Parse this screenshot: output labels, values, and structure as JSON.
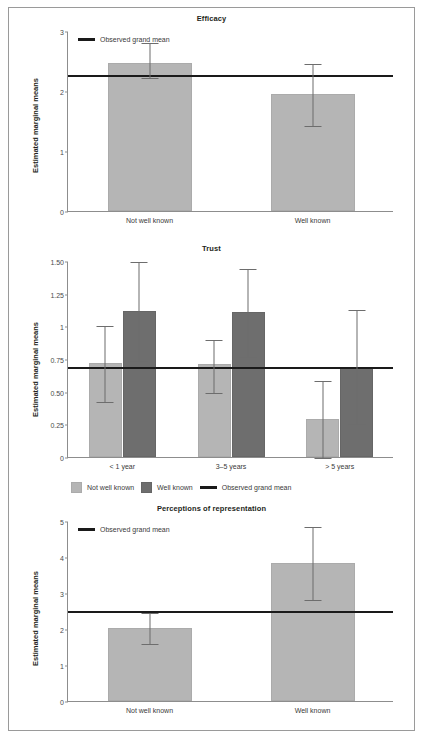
{
  "figure": {
    "ylabel": "Estimated marginal means",
    "grand_mean_legend": "Observed grand mean",
    "legend_items": [
      "Not well known",
      "Well known",
      "Observed grand mean"
    ]
  },
  "chart_data": [
    {
      "type": "bar",
      "title": "Efficacy",
      "xlabel": "",
      "ylabel": "Estimated marginal means",
      "categories": [
        "Not well known",
        "Well known"
      ],
      "values": [
        2.47,
        1.95
      ],
      "error_low": [
        2.23,
        1.44
      ],
      "error_high": [
        2.81,
        2.46
      ],
      "grand_mean": 2.27,
      "ylim": [
        0,
        3
      ],
      "yticks": [
        "0",
        "1",
        "2",
        "3"
      ],
      "ytick_values": [
        0,
        1,
        2,
        3
      ],
      "grid": false,
      "legend": [
        "Observed grand mean"
      ],
      "legend_position": "top-left",
      "bar_style": [
        "light",
        "light"
      ]
    },
    {
      "type": "bar",
      "title": "Trust",
      "xlabel": "",
      "ylabel": "Estimated marginal means",
      "categories": [
        "< 1 year",
        "3–5 years",
        "> 5 years"
      ],
      "series": [
        {
          "name": "Not well known",
          "style": "light",
          "values": [
            0.72,
            0.71,
            0.29
          ],
          "error_low": [
            0.43,
            0.5,
            0.0
          ],
          "error_high": [
            1.01,
            0.9,
            0.59
          ]
        },
        {
          "name": "Well known",
          "style": "dark",
          "values": [
            1.12,
            1.11,
            0.69
          ],
          "error_low": [
            0.74,
            0.77,
            0.26
          ],
          "error_high": [
            1.5,
            1.45,
            1.13
          ]
        }
      ],
      "grand_mean": 0.685,
      "ylim": [
        0,
        1.5
      ],
      "yticks": [
        "0",
        "0.25",
        "0.50",
        "0.75",
        "1",
        "1.25",
        "1.50"
      ],
      "ytick_values": [
        0,
        0.25,
        0.5,
        0.75,
        1,
        1.25,
        1.5
      ],
      "grid": false,
      "legend": [
        "Not well known",
        "Well known",
        "Observed grand mean"
      ],
      "legend_position": "bottom"
    },
    {
      "type": "bar",
      "title": "Perceptions of representation",
      "xlabel": "",
      "ylabel": "Estimated marginal means",
      "categories": [
        "Not well known",
        "Well known"
      ],
      "values": [
        2.02,
        3.82
      ],
      "error_low": [
        1.6,
        2.82
      ],
      "error_high": [
        2.47,
        4.85
      ],
      "grand_mean": 2.51,
      "ylim": [
        0,
        5
      ],
      "yticks": [
        "0",
        "1",
        "2",
        "3",
        "4",
        "5"
      ],
      "ytick_values": [
        0,
        1,
        2,
        3,
        4,
        5
      ],
      "grid": false,
      "legend": [
        "Observed grand mean"
      ],
      "legend_position": "top-left",
      "bar_style": [
        "light",
        "light"
      ]
    }
  ]
}
